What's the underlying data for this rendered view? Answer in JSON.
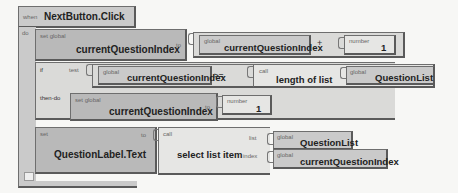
{
  "event_block": {
    "when_label": "when",
    "event_name": "NextButton.Click",
    "do_label": "do"
  },
  "set_increment": {
    "set_label": "set global",
    "var_name": "currentQuestionIndex",
    "to_label": "to",
    "add": {
      "left": {
        "prefix": "global",
        "name": "currentQuestionIndex"
      },
      "operator": "+",
      "right": {
        "prefix": "number",
        "value": "1"
      }
    }
  },
  "if_block": {
    "if_label": "if",
    "test_label": "test",
    "then_label": "then-do",
    "test": {
      "left": {
        "prefix": "global",
        "name": "currentQuestionIndex"
      },
      "operator": ">=",
      "call": {
        "prefix": "call",
        "name": "length of list",
        "arg_label": "list",
        "arg": {
          "prefix": "global",
          "name": "QuestionList"
        }
      }
    },
    "then_set": {
      "set_label": "set global",
      "var_name": "currentQuestionIndex",
      "to_label": "to",
      "value": {
        "prefix": "number",
        "value": "1"
      }
    }
  },
  "set_label_block": {
    "set_label": "set",
    "property": "QuestionLabel.Text",
    "to_label": "to",
    "call": {
      "prefix": "call",
      "name": "select list item",
      "list_label": "list",
      "list_arg": {
        "prefix": "global",
        "name": "QuestionList"
      },
      "index_label": "index",
      "index_arg": {
        "prefix": "global",
        "name": "currentQuestionIndex"
      }
    }
  }
}
